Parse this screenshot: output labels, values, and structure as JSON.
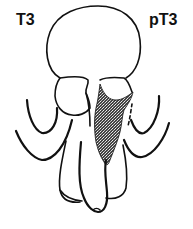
{
  "figure": {
    "type": "anatomical-diagram",
    "labels": {
      "left": "T3",
      "right": "pT3"
    },
    "colors": {
      "line": "#111111",
      "tumor_fill": "#3a3a3a",
      "background": "#ffffff"
    }
  }
}
